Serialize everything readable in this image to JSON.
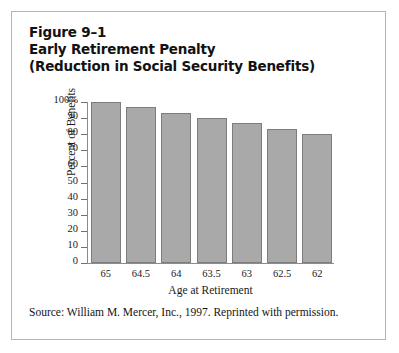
{
  "figure": {
    "number_label": "Figure 9–1",
    "title_line_1": "Early Retirement Penalty",
    "title_line_2": "(Reduction in Social Security Benefits)",
    "source_note": "Source: William M. Mercer, Inc., 1997. Reprinted with permission.",
    "border_color": "#b4b4b4"
  },
  "chart_data": {
    "type": "bar",
    "title": "Early Retirement Penalty (Reduction in Social Security Benefits)",
    "xlabel": "Age at Retirement",
    "ylabel": "Percent of Benefits",
    "categories": [
      "65",
      "64.5",
      "64",
      "63.5",
      "63",
      "62.5",
      "62"
    ],
    "values": [
      100,
      96.7,
      93.3,
      90,
      86.7,
      83.3,
      80
    ],
    "ylim": [
      0,
      100
    ],
    "ytick_values": [
      100,
      90,
      80,
      70,
      60,
      50,
      40,
      30,
      20,
      10,
      0
    ],
    "ytick_labels": [
      "100%",
      "90",
      "80",
      "70",
      "60",
      "50",
      "40",
      "30",
      "20",
      "10",
      "0"
    ],
    "grid": false,
    "legend": false,
    "bar_fill_color": "#a9a9a9",
    "bar_edge_color": "#7d7d7d",
    "axis_color": "#8c8c8c"
  }
}
